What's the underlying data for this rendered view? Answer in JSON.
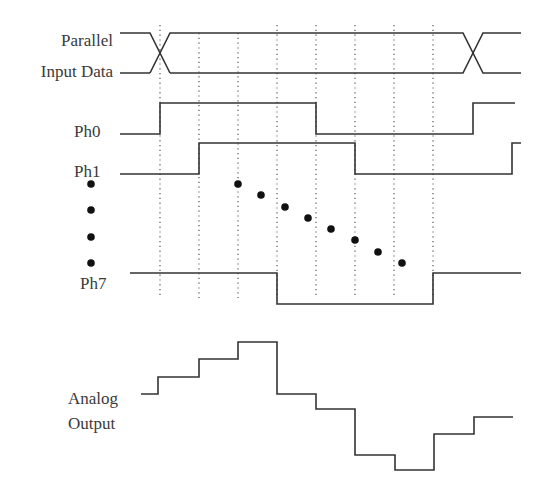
{
  "labels": {
    "parallel_line1": "Parallel",
    "parallel_line2": "Input Data",
    "ph0": "Ph0",
    "ph1": "Ph1",
    "ph7": "Ph7",
    "analog_line1": "Analog",
    "analog_line2": "Output"
  },
  "colors": {
    "stroke": "#333333",
    "dotted": "#555555",
    "dots": "#111111",
    "background": "#ffffff"
  },
  "timing": {
    "clock_edges_x": [
      160,
      199,
      238,
      277,
      316,
      355,
      394,
      433
    ],
    "dotted_y_range": [
      25,
      298
    ],
    "signals": [
      {
        "name": "Parallel Input Data",
        "type": "bus",
        "transitions_x": [
          160,
          473
        ]
      },
      {
        "name": "Ph0",
        "levels": "low,high,high,high,high,low,low,low,low,high",
        "rise_x": [
          160,
          473
        ],
        "fall_x": [
          316
        ]
      },
      {
        "name": "Ph1",
        "rise_x": [
          199,
          512
        ],
        "fall_x": [
          355
        ]
      },
      {
        "name": "Ph7",
        "rise_x": [
          433
        ],
        "fall_x": [
          277
        ]
      }
    ],
    "ellipsis_dots": {
      "vertical": [
        [
          91,
          184
        ],
        [
          91,
          210
        ],
        [
          91,
          237
        ],
        [
          91,
          263
        ]
      ],
      "diagonal": [
        [
          238,
          184
        ],
        [
          261,
          195
        ],
        [
          285,
          207
        ],
        [
          308,
          218
        ],
        [
          331,
          229
        ],
        [
          355,
          240
        ],
        [
          378,
          252
        ],
        [
          402,
          263
        ]
      ]
    },
    "analog_output_steps": [
      {
        "x_from": 141,
        "x_to": 158,
        "y": 394
      },
      {
        "x_from": 158,
        "x_to": 199,
        "y": 377
      },
      {
        "x_from": 199,
        "x_to": 238,
        "y": 359
      },
      {
        "x_from": 238,
        "x_to": 277,
        "y": 342
      },
      {
        "x_from": 277,
        "x_to": 316,
        "y": 394
      },
      {
        "x_from": 316,
        "x_to": 355,
        "y": 409
      },
      {
        "x_from": 355,
        "x_to": 395,
        "y": 455
      },
      {
        "x_from": 395,
        "x_to": 434,
        "y": 470
      },
      {
        "x_from": 434,
        "x_to": 474,
        "y": 434
      },
      {
        "x_from": 474,
        "x_to": 513,
        "y": 417
      }
    ]
  }
}
